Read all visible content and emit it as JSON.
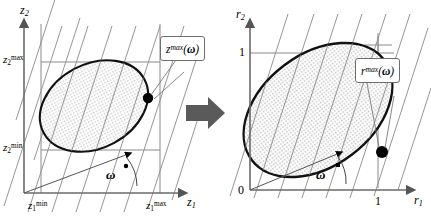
{
  "figure": {
    "type": "diagram",
    "transition_arrow": "block-arrow-right",
    "arrow_color": "#5a5a5a"
  },
  "colors": {
    "outline": "#111111",
    "grid": "#8a8a8a",
    "box": "#8a8a8a",
    "fill": "#e3e3e3",
    "arrow": "#5a5a5a",
    "callout_border": "#6e6e6e",
    "background": "#ffffff"
  },
  "left_panel": {
    "name": "z-space-plot",
    "y_axis_label": "z",
    "y_axis_sub": "2",
    "x_axis_label": "z",
    "x_axis_sub": "1",
    "ticks": {
      "y_max_base": "z",
      "y_max_sub": "2",
      "y_max_sup": "max",
      "y_min_base": "z",
      "y_min_sub": "2",
      "y_min_sup": "min",
      "x_max_base": "z",
      "x_max_sub": "1",
      "x_max_sup": "max",
      "x_min_base": "z",
      "x_min_sub": "1",
      "x_min_sup": "min"
    },
    "angle_label": "ω",
    "callout": {
      "base": "z",
      "sup": "max",
      "arg_open": "(",
      "arg": "ω",
      "arg_close": ")"
    },
    "marker": "extreme-point-dot"
  },
  "right_panel": {
    "name": "r-space-plot",
    "y_axis_label": "r",
    "y_axis_sub": "2",
    "x_axis_label": "r",
    "x_axis_sub": "1",
    "ticks": {
      "origin": "0",
      "y_one": "1",
      "x_one": "1"
    },
    "angle_label": "ω",
    "callout": {
      "base": "r",
      "sup": "max",
      "arg_open": "(",
      "arg": "ω",
      "arg_close": ")"
    },
    "marker": "extreme-point-dot"
  }
}
